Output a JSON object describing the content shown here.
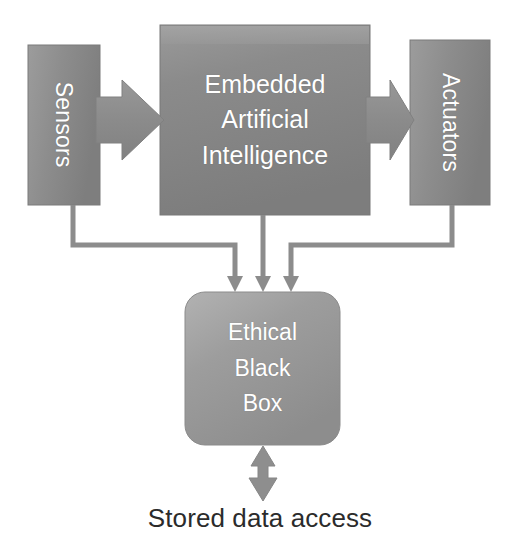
{
  "diagram": {
    "type": "block-diagram",
    "background_color": "#ffffff",
    "nodes": {
      "sensors": {
        "label": "Sensors",
        "shape": "rectangle",
        "orientation": "vertical-text",
        "fill_color": "#8e8e8e",
        "text_color": "#ffffff"
      },
      "embedded_ai": {
        "line1": "Embedded",
        "line2": "Artificial",
        "line3": "Intelligence",
        "shape": "rectangle",
        "fill_color": "#8a8a8a",
        "text_color": "#ffffff"
      },
      "actuators": {
        "label": "Actuators",
        "shape": "rectangle",
        "orientation": "vertical-text",
        "fill_color": "#8e8e8e",
        "text_color": "#ffffff"
      },
      "ethical_black_box": {
        "line1": "Ethical",
        "line2": "Black",
        "line3": "Box",
        "shape": "rounded-rectangle",
        "fill_color": "#9a9a9a",
        "text_color": "#ffffff"
      }
    },
    "connectors": [
      {
        "name": "sensors-to-embedded-ai",
        "style": "block-arrow",
        "from": "sensors",
        "to": "embedded_ai",
        "direction": "right",
        "color": "#8a8a8a"
      },
      {
        "name": "embedded-ai-to-actuators",
        "style": "block-arrow",
        "from": "embedded_ai",
        "to": "actuators",
        "direction": "right",
        "color": "#8a8a8a"
      },
      {
        "name": "sensors-to-ethical-black-box",
        "style": "elbow-line-arrow",
        "from": "sensors",
        "to": "ethical_black_box",
        "direction": "down",
        "color": "#8a8a8a"
      },
      {
        "name": "embedded-ai-to-ethical-black-box",
        "style": "line-arrow",
        "from": "embedded_ai",
        "to": "ethical_black_box",
        "direction": "down",
        "color": "#8a8a8a"
      },
      {
        "name": "actuators-to-ethical-black-box",
        "style": "elbow-line-arrow",
        "from": "actuators",
        "to": "ethical_black_box",
        "direction": "down",
        "color": "#8a8a8a"
      },
      {
        "name": "ethical-black-box-to-stored-data-access",
        "style": "double-headed-block-arrow",
        "from": "ethical_black_box",
        "to": "stored_data_access",
        "direction": "bidirectional-vertical",
        "color": "#8a8a8a"
      }
    ],
    "captions": {
      "stored_data_access": "Stored data access"
    }
  }
}
